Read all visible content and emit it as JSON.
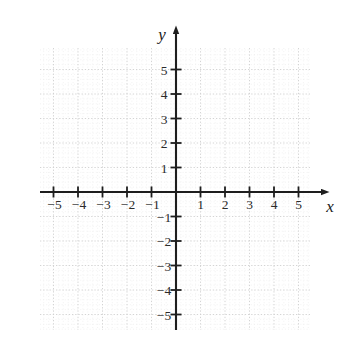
{
  "chart_data": {
    "type": "scatter",
    "title": "",
    "subtitle": "",
    "xlabel": "x",
    "ylabel": "y",
    "xlim": [
      -6.0,
      6.2
    ],
    "ylim": [
      -6.2,
      6.5
    ],
    "x_ticks": [
      -5,
      -4,
      -3,
      -2,
      -1,
      1,
      2,
      3,
      4,
      5
    ],
    "y_ticks": [
      5,
      4,
      3,
      2,
      1,
      -1,
      -2,
      -3,
      -4,
      -5
    ],
    "x_tick_labels": [
      "−5",
      "−4",
      "−3",
      "−2",
      "−1",
      "1",
      "2",
      "3",
      "4",
      "5"
    ],
    "y_tick_labels": [
      "5",
      "4",
      "3",
      "2",
      "1",
      "−1",
      "−2",
      "−3",
      "−4",
      "−5"
    ],
    "grid": true,
    "grid_style": "dotted",
    "grid_major_step": 1,
    "grid_minor_per_major": 5,
    "legend": null,
    "series": [],
    "values": [],
    "annotations": [],
    "axis_arrows": [
      "x-positive",
      "y-positive"
    ],
    "origin_label": ""
  },
  "figure": {
    "x_axis_name": "x",
    "y_axis_name": "y"
  },
  "colors": {
    "background": "#ffffff",
    "axis": "#1e1e1e",
    "tick_label": "#2b2b2b",
    "grid_major": "#cfcfcf",
    "grid_minor": "#e8e8e8"
  }
}
